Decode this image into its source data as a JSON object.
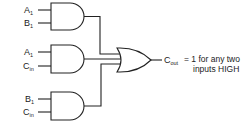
{
  "diagram": {
    "type": "logic-circuit",
    "gates": [
      {
        "id": "and1",
        "kind": "AND",
        "inputs": [
          {
            "main": "A",
            "sub": "1"
          },
          {
            "main": "B",
            "sub": "1"
          }
        ]
      },
      {
        "id": "and2",
        "kind": "AND",
        "inputs": [
          {
            "main": "A",
            "sub": "1"
          },
          {
            "main": "C",
            "sub": "in"
          }
        ]
      },
      {
        "id": "and3",
        "kind": "AND",
        "inputs": [
          {
            "main": "B",
            "sub": "1"
          },
          {
            "main": "C",
            "sub": "in"
          }
        ]
      },
      {
        "id": "or1",
        "kind": "OR",
        "inputs": [
          "and1",
          "and2",
          "and3"
        ]
      }
    ],
    "output": {
      "main": "C",
      "sub": "out",
      "note_line1": "= 1 for any two",
      "note_line2": "inputs HIGH"
    }
  }
}
